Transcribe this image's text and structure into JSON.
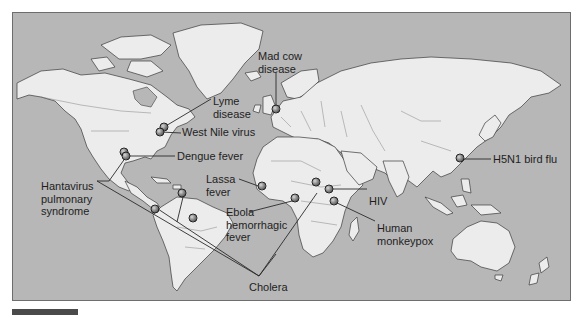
{
  "figure": {
    "type": "world-map",
    "colors": {
      "ocean": "#b7b7b7",
      "land": "#ececec",
      "outline": "#3a3a3a",
      "marker": "#8a8a8a",
      "leader": "#2a2a2a"
    }
  },
  "diseases": [
    {
      "id": "mad-cow",
      "label_lines": [
        "Mad cow",
        "disease"
      ],
      "label": "Mad cow disease",
      "region": "United Kingdom"
    },
    {
      "id": "lyme",
      "label_lines": [
        "Lyme",
        "disease"
      ],
      "label": "Lyme disease",
      "region": "Northeastern United States"
    },
    {
      "id": "west-nile",
      "label_lines": [
        "West Nile virus"
      ],
      "label": "West Nile virus",
      "region": "Eastern United States"
    },
    {
      "id": "dengue",
      "label_lines": [
        "Dengue fever"
      ],
      "label": "Dengue fever",
      "region": "Mexico / Caribbean / Northern South America"
    },
    {
      "id": "hantavirus",
      "label_lines": [
        "Hantavirus",
        "pulmonary",
        "syndrome"
      ],
      "label": "Hantavirus pulmonary syndrome",
      "region": "Southwestern United States / South America"
    },
    {
      "id": "lassa",
      "label_lines": [
        "Lassa",
        "fever"
      ],
      "label": "Lassa fever",
      "region": "West Africa"
    },
    {
      "id": "ebola",
      "label_lines": [
        "Ebola",
        "hemorrhagic",
        "fever"
      ],
      "label": "Ebola hemorrhagic fever",
      "region": "Central Africa"
    },
    {
      "id": "cholera",
      "label_lines": [
        "Cholera"
      ],
      "label": "Cholera",
      "region": "Peru / Central Africa"
    },
    {
      "id": "hiv",
      "label_lines": [
        "HIV"
      ],
      "label": "HIV",
      "region": "East Africa"
    },
    {
      "id": "monkeypox",
      "label_lines": [
        "Human",
        "monkeypox"
      ],
      "label": "Human monkeypox",
      "region": "Central/East Africa"
    },
    {
      "id": "h5n1",
      "label_lines": [
        "H5N1 bird flu"
      ],
      "label": "H5N1 bird flu",
      "region": "Southeast China / Hong Kong"
    }
  ]
}
